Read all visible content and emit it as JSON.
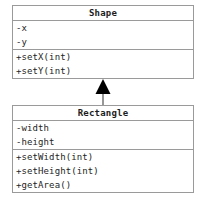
{
  "diagram": {
    "type": "uml-class-diagram",
    "background_color": "#ffffff",
    "border_color": "#9a9a9a",
    "text_color": "#242424",
    "connector_color": "#000000",
    "classes": [
      {
        "name": "Shape",
        "attributes": [
          {
            "text": "-x"
          },
          {
            "text": "-y"
          }
        ],
        "methods": [
          {
            "text": "+setX(int)"
          },
          {
            "text": "+setY(int)"
          }
        ]
      },
      {
        "name": "Rectangle",
        "attributes": [
          {
            "text": "-width"
          },
          {
            "text": "-height"
          }
        ],
        "methods": [
          {
            "text": "+setWidth(int)"
          },
          {
            "text": "+setHeight(int)"
          },
          {
            "text": "+getArea()"
          }
        ]
      }
    ],
    "relationship": {
      "kind": "generalization",
      "from": "Rectangle",
      "to": "Shape",
      "arrowhead": "filled-triangle"
    }
  }
}
